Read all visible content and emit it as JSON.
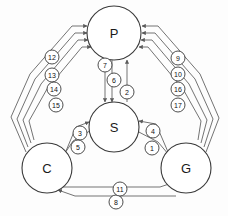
{
  "diagram": {
    "background_color": "#fdfdfd",
    "node_color": "#ffffff",
    "stroke_color": "#3a3a3a",
    "edge_color": "#5a5a5a",
    "nodes": [
      {
        "id": "P",
        "label": "P",
        "cx": 114,
        "cy": 33,
        "r": 27
      },
      {
        "id": "S",
        "label": "S",
        "cx": 114,
        "cy": 127,
        "r": 25
      },
      {
        "id": "C",
        "label": "C",
        "cx": 47,
        "cy": 168,
        "r": 25
      },
      {
        "id": "G",
        "label": "G",
        "cx": 186,
        "cy": 168,
        "r": 25
      }
    ],
    "edge_labels": [
      {
        "n": "1",
        "cx": 152,
        "cy": 148
      },
      {
        "n": "2",
        "cx": 127,
        "cy": 92
      },
      {
        "n": "3",
        "cx": 80,
        "cy": 133
      },
      {
        "n": "4",
        "cx": 153,
        "cy": 131
      },
      {
        "n": "5",
        "cx": 78,
        "cy": 147
      },
      {
        "n": "6",
        "cx": 114,
        "cy": 80
      },
      {
        "n": "7",
        "cx": 105,
        "cy": 65
      },
      {
        "n": "8",
        "cx": 116,
        "cy": 202
      },
      {
        "n": "9",
        "cx": 178,
        "cy": 58
      },
      {
        "n": "10",
        "cx": 178,
        "cy": 74
      },
      {
        "n": "11",
        "cx": 120,
        "cy": 189
      },
      {
        "n": "12",
        "cx": 52,
        "cy": 57
      },
      {
        "n": "13",
        "cx": 52,
        "cy": 75
      },
      {
        "n": "14",
        "cx": 54,
        "cy": 89
      },
      {
        "n": "15",
        "cx": 56,
        "cy": 105
      },
      {
        "n": "16",
        "cx": 178,
        "cy": 89
      },
      {
        "n": "17",
        "cx": 178,
        "cy": 105
      }
    ],
    "edges": [
      {
        "id": "e12",
        "label": "12",
        "from": "C",
        "to": "P",
        "d": "M 26 152 L 11 117 L 30 74 L 72 26 L 87 26"
      },
      {
        "id": "e13",
        "label": "13",
        "from": "C",
        "to": "P",
        "d": "M 28 147 L 17 119 L 35 79 L 75 33 L 87 33"
      },
      {
        "id": "e14",
        "label": "14",
        "from": "C",
        "to": "P",
        "d": "M 31 143 L 23 120 L 41 84 L 78 40 L 88 40"
      },
      {
        "id": "e15",
        "label": "15",
        "from": "C",
        "to": "P",
        "d": "M 34 140 L 29 121 L 47 89 L 82 47 L 91 47"
      },
      {
        "id": "e9",
        "label": "9",
        "from": "G",
        "to": "P",
        "d": "M 206 152 L 219 118 L 200 74 L 158 26 L 142 26"
      },
      {
        "id": "e10",
        "label": "10",
        "from": "G",
        "to": "P",
        "d": "M 204 147 L 213 119 L 195 79 L 155 33 L 142 33"
      },
      {
        "id": "e16",
        "label": "16",
        "from": "G",
        "to": "P",
        "d": "M 201 143 L 207 120 L 189 84 L 152 40 L 141 40"
      },
      {
        "id": "e17",
        "label": "17",
        "from": "G",
        "to": "P",
        "d": "M 198 140 L 201 121 L 183 89 L 148 47 L 139 47"
      },
      {
        "id": "e7",
        "label": "7",
        "from": "P",
        "to": "S",
        "d": "M 105 60 L 105 102"
      },
      {
        "id": "e6",
        "label": "6",
        "from": "P",
        "to": "S",
        "d": "M 112 60 L 112 102"
      },
      {
        "id": "e2",
        "label": "2",
        "from": "S",
        "to": "P",
        "d": "M 127 102 L 127 60"
      },
      {
        "id": "e3",
        "label": "3",
        "from": "C",
        "to": "S",
        "d": "M 66 151 L 76 127 L 89 122"
      },
      {
        "id": "e5",
        "label": "5",
        "from": "S",
        "to": "C",
        "d": "M 93 129 L 73 141 L 63 156"
      },
      {
        "id": "e4",
        "label": "4",
        "from": "G",
        "to": "S",
        "d": "M 168 152 L 156 124 L 139 121"
      },
      {
        "id": "e1",
        "label": "1",
        "from": "S",
        "to": "G",
        "d": "M 135 130 L 158 142 L 169 155"
      },
      {
        "id": "e11",
        "label": "11",
        "from": "C",
        "to": "G",
        "d": "M 58 187 L 103 187 L 160 187 L 175 182"
      },
      {
        "id": "e8",
        "label": "8",
        "from": "G",
        "to": "C",
        "d": "M 176 196 L 120 196 L 75 196 L 58 190"
      }
    ]
  }
}
